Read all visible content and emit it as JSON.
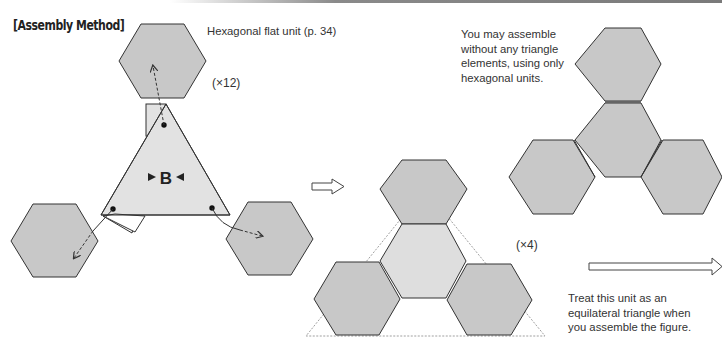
{
  "heading": "[Assembly Method]",
  "labels": {
    "unit_name": "Hexagonal flat unit (p. 34)",
    "count_12": "(×12)",
    "count_4": "(×4)",
    "triangle_letter": "B",
    "note_top": [
      "You may assemble",
      "without any triangle",
      "elements, using only",
      "hexagonal units."
    ],
    "note_bottom": [
      "Treat this unit as an",
      "equilateral triangle when",
      "you assemble the figure."
    ]
  },
  "colors": {
    "hex_fill": "#c8c8c8",
    "center_hex_fill": "#dedede",
    "triangle_fill": "#e2e2e2",
    "stroke": "#333333"
  }
}
